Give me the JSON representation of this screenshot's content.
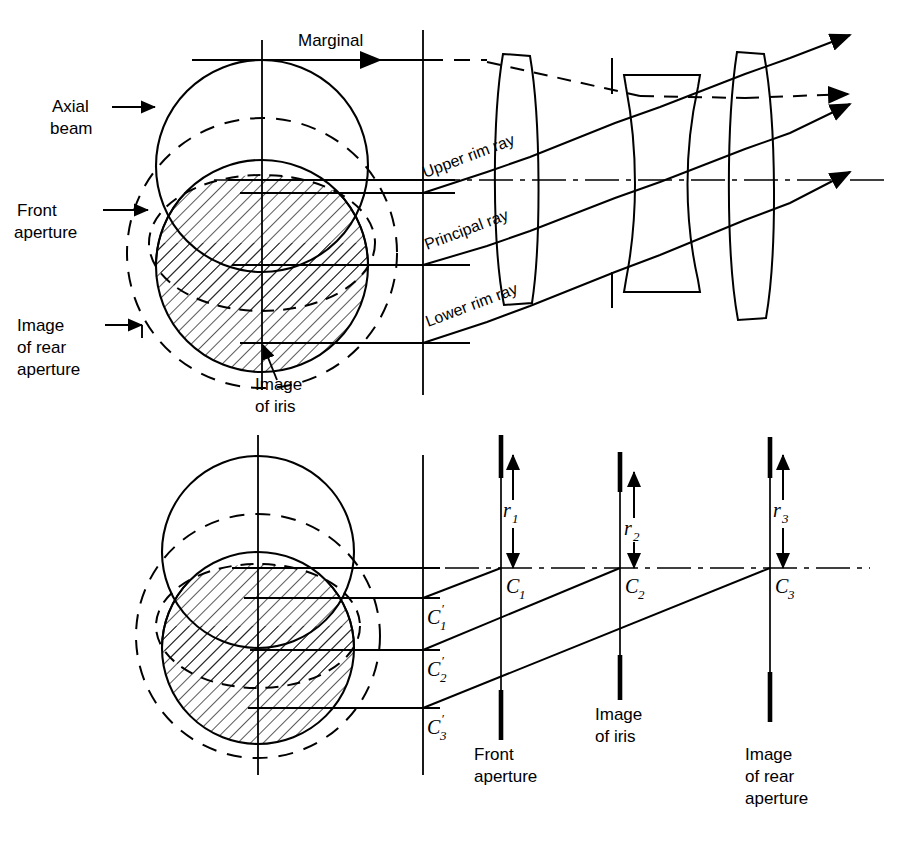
{
  "figure": {
    "kind": "optical-vignetting-diagram",
    "background": "#ffffff",
    "ink": "#000000",
    "hatch_color": "#000000"
  },
  "top_panel": {
    "labels": {
      "axial_beam_l1": "Axial",
      "axial_beam_l2": "beam",
      "front_aperture_l1": "Front",
      "front_aperture_l2": "aperture",
      "image_of_rear_l1": "Image",
      "image_of_rear_l2": "of rear",
      "image_of_rear_l3": "aperture",
      "image_of_iris_l1": "Image",
      "image_of_iris_l2": "of iris",
      "marginal": "Marginal",
      "upper_rim_ray": "Upper rim ray",
      "principal_ray": "Principal ray",
      "lower_rim_ray": "Lower rim ray"
    }
  },
  "bottom_panel": {
    "labels": {
      "c1": "C",
      "c1_sub": "1",
      "c2": "C",
      "c2_sub": "2",
      "c3": "C",
      "c3_sub": "3",
      "c1p": "C",
      "c1p_sub": "1",
      "c1p_prime": "′",
      "c2p": "C",
      "c2p_sub": "2",
      "c2p_prime": "′",
      "c3p": "C",
      "c3p_sub": "3",
      "c3p_prime": "′",
      "r1": "r",
      "r1_sub": "1",
      "r2": "r",
      "r2_sub": "2",
      "r3": "r",
      "r3_sub": "3",
      "front_aperture_l1": "Front",
      "front_aperture_l2": "aperture",
      "image_of_iris_l1": "Image",
      "image_of_iris_l2": "of iris",
      "image_of_rear_l1": "Image",
      "image_of_rear_l2": "of rear",
      "image_of_rear_l3": "aperture"
    }
  }
}
